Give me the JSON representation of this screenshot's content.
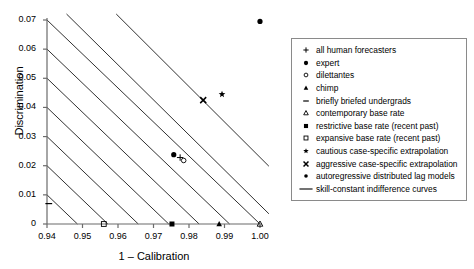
{
  "chart_data": {
    "type": "scatter",
    "title": "",
    "xlabel": "1 – Calibration",
    "ylabel": "Discrimination",
    "xlim": [
      0.94,
      1.0
    ],
    "ylim": [
      0,
      0.07
    ],
    "xticks": [
      "0.94",
      "0.95",
      "0.96",
      "0.97",
      "0.98",
      "0.99",
      "1.00"
    ],
    "yticks": [
      "0",
      "0.01",
      "0.02",
      "0.03",
      "0.04",
      "0.05",
      "0.06",
      "0.07"
    ],
    "grid": false,
    "legend_position": "right",
    "points": [
      {
        "name": "all human forecasters",
        "marker": "plus",
        "x": 0.9775,
        "y": 0.0228
      },
      {
        "name": "expert",
        "marker": "filled-circle",
        "x": 1.0,
        "y": 0.0695
      },
      {
        "name": "dilettantes",
        "marker": "open-circle",
        "x": 0.9785,
        "y": 0.0218
      },
      {
        "name": "chimp",
        "marker": "filled-triangle",
        "x": 0.9885,
        "y": 0.0
      },
      {
        "name": "briefly briefed undergrads",
        "marker": "dash",
        "x": 0.9405,
        "y": 0.007
      },
      {
        "name": "contemporary base rate",
        "marker": "open-triangle",
        "x": 1.0,
        "y": 0.0
      },
      {
        "name": "restrictive base rate (recent past)",
        "marker": "filled-square",
        "x": 0.9752,
        "y": 0.0
      },
      {
        "name": "expansive base rate (recent past)",
        "marker": "open-square",
        "x": 0.956,
        "y": 0.0
      },
      {
        "name": "cautious case-specific extrapolation",
        "marker": "star",
        "x": 0.9893,
        "y": 0.0445
      },
      {
        "name": "aggressive case-specific extrapolation",
        "marker": "cross-x",
        "x": 0.984,
        "y": 0.0425
      },
      {
        "name": "autoregressive distributed lag models",
        "marker": "filled-circle",
        "x": 0.9757,
        "y": 0.0238
      }
    ],
    "indifference_curves": {
      "label": "skill-constant indifference curves",
      "description": "seven parallel negatively sloped straight lines of constant skill",
      "y_intercepts_at_x_min": [
        0.01,
        0.02,
        0.03,
        0.04,
        0.05,
        0.06,
        0.07
      ],
      "slope_per_unit_x": -1.1667,
      "x_span": 0.06
    }
  },
  "legend": {
    "items": [
      {
        "symbol": "plus",
        "label": "all human forecasters"
      },
      {
        "symbol": "filled-circle",
        "label": "expert"
      },
      {
        "symbol": "open-circle",
        "label": "dilettantes"
      },
      {
        "symbol": "filled-triangle",
        "label": "chimp"
      },
      {
        "symbol": "dash",
        "label": "briefly briefed undergrads"
      },
      {
        "symbol": "open-triangle",
        "label": "contemporary base rate"
      },
      {
        "symbol": "filled-square",
        "label": "restrictive base rate (recent past)"
      },
      {
        "symbol": "open-square",
        "label": "expansive base rate (recent past)"
      },
      {
        "symbol": "star",
        "label": "cautious case-specific extrapolation"
      },
      {
        "symbol": "cross-x",
        "label": "aggressive case-specific extrapolation"
      },
      {
        "symbol": "filled-circle-small",
        "label": "autoregressive distributed lag models"
      },
      {
        "symbol": "line",
        "label": "skill-constant indifference curves"
      }
    ]
  },
  "colors": {
    "axis": "#6b6b6b",
    "curve": "#1a1a1a",
    "marker": "#000000",
    "legend_border": "#8a8a8a",
    "background": "#ffffff"
  }
}
